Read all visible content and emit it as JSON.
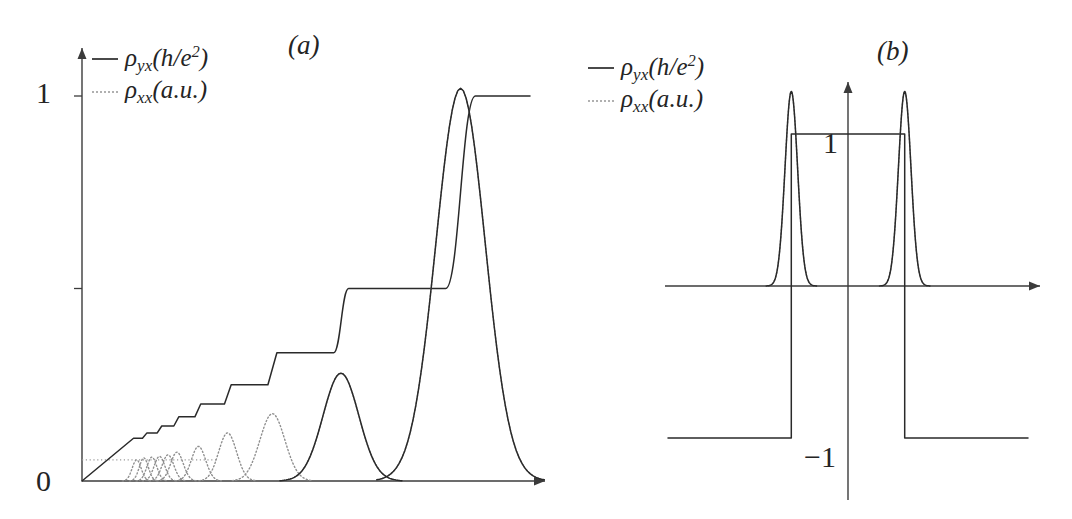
{
  "figure": {
    "background": "#ffffff",
    "curve_color": "#2a2a2a",
    "dotted_color": "#8f8f8f",
    "axis_color": "#3b3b3b"
  },
  "panels": [
    {
      "tag": "(a)",
      "legend": [
        {
          "style": "solid",
          "symbol": "ρ",
          "sub": "yx",
          "units": "(h/e",
          "sup": "2",
          "close": ")"
        },
        {
          "style": "dotted",
          "symbol": "ρ",
          "sub": "xx",
          "units": "(a.u.",
          "sup": "",
          "close": ")"
        }
      ],
      "y_ticks": [
        {
          "label": "1",
          "value": 1.0
        },
        {
          "label": "",
          "value": 0.5
        },
        {
          "label": "0",
          "value": 0.0
        }
      ],
      "x_ticks": []
    },
    {
      "tag": "(b)",
      "legend": [
        {
          "style": "solid",
          "symbol": "ρ",
          "sub": "yx",
          "units": "(h/e",
          "sup": "2",
          "close": ")"
        },
        {
          "style": "dotted",
          "symbol": "ρ",
          "sub": "xx",
          "units": "(a.u.",
          "sup": "",
          "close": ")"
        }
      ],
      "y_ticks": [
        {
          "label": "1",
          "value": 1.0
        },
        {
          "label": "−1",
          "value": -1.0
        }
      ],
      "x_ticks": []
    }
  ],
  "chart_data": [
    {
      "type": "line",
      "title": "(a)",
      "xlabel": "",
      "ylabel": "",
      "xlim": [
        0,
        1
      ],
      "ylim": [
        0,
        1.08
      ],
      "grid": false,
      "legend_position": "top-left",
      "series": [
        {
          "name": "rho_yx (h/e^2)",
          "style": "solid",
          "description": "Quantum Hall staircase: plateaus at 1/n approached from a linear classical slope at low field.",
          "plateaus": [
            {
              "value": 0.1111,
              "x_start": 0.115,
              "x_end": 0.135
            },
            {
              "value": 0.125,
              "x_start": 0.145,
              "x_end": 0.168
            },
            {
              "value": 0.1429,
              "x_start": 0.178,
              "x_end": 0.205
            },
            {
              "value": 0.1667,
              "x_start": 0.216,
              "x_end": 0.252
            },
            {
              "value": 0.2,
              "x_start": 0.265,
              "x_end": 0.318
            },
            {
              "value": 0.25,
              "x_start": 0.333,
              "x_end": 0.415
            },
            {
              "value": 0.3333,
              "x_start": 0.435,
              "x_end": 0.562
            },
            {
              "value": 0.5,
              "x_start": 0.595,
              "x_end": 0.812
            },
            {
              "value": 1.0,
              "x_start": 0.878,
              "x_end": 1.0
            }
          ],
          "linear_ramp": {
            "x_start": 0.0,
            "x_end": 0.115,
            "y_start": 0.0,
            "y_end": 0.1111
          }
        },
        {
          "name": "rho_xx (a.u.)",
          "style": "dotted",
          "description": "Longitudinal resistivity: Shubnikov-de Haas oscillations becoming isolated peaks at each plateau transition, growing in width and height toward higher field.",
          "peaks": [
            {
              "center": 0.122,
              "height": 0.055,
              "width": 0.01
            },
            {
              "center": 0.138,
              "height": 0.06,
              "width": 0.01
            },
            {
              "center": 0.156,
              "height": 0.062,
              "width": 0.011
            },
            {
              "center": 0.173,
              "height": 0.064,
              "width": 0.012
            },
            {
              "center": 0.192,
              "height": 0.068,
              "width": 0.013
            },
            {
              "center": 0.212,
              "height": 0.075,
              "width": 0.014
            },
            {
              "center": 0.26,
              "height": 0.09,
              "width": 0.016
            },
            {
              "center": 0.325,
              "height": 0.125,
              "width": 0.02
            },
            {
              "center": 0.425,
              "height": 0.175,
              "width": 0.028
            },
            {
              "center": 0.578,
              "height": 0.28,
              "width": 0.04
            },
            {
              "center": 0.845,
              "height": 1.02,
              "width": 0.055
            }
          ]
        }
      ]
    },
    {
      "type": "line",
      "title": "(b)",
      "xlabel": "",
      "ylabel": "",
      "xlim": [
        -1,
        1
      ],
      "ylim": [
        -1.35,
        1.35
      ],
      "grid": false,
      "legend_position": "top-left",
      "series": [
        {
          "name": "rho_yx (h/e^2)",
          "style": "solid",
          "description": "Quantum anomalous Hall: a single plateau at +1 between two transitions, with -1 outside.",
          "steps": [
            {
              "value": -1.0,
              "x_start": -1.0,
              "x_end": -0.315
            },
            {
              "value": 1.0,
              "x_start": -0.315,
              "x_end": 0.315
            },
            {
              "value": -1.0,
              "x_start": 0.315,
              "x_end": 1.0
            }
          ]
        },
        {
          "name": "rho_xx (a.u.)",
          "style": "dotted",
          "description": "Longitudinal resistivity: one sharp peak at each of the two transitions.",
          "peaks": [
            {
              "center": -0.315,
              "height": 1.28,
              "width": 0.035
            },
            {
              "center": 0.315,
              "height": 1.28,
              "width": 0.035
            }
          ]
        }
      ]
    }
  ]
}
